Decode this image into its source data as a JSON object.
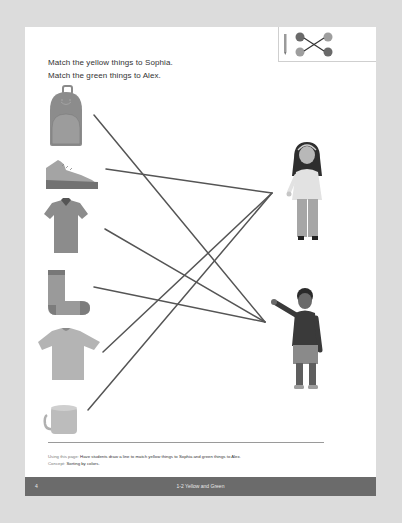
{
  "instructions": {
    "line1": "Match the yellow things to Sophia.",
    "line2": "Match the green things to Alex."
  },
  "icon_box": {
    "icon": "matching-lines-icon"
  },
  "items": [
    {
      "name": "backpack",
      "icon": "backpack-icon",
      "color": "yellow"
    },
    {
      "name": "sneaker",
      "icon": "sneaker-icon",
      "color": "green"
    },
    {
      "name": "polo-shirt",
      "icon": "polo-shirt-icon",
      "color": "green"
    },
    {
      "name": "sock",
      "icon": "sock-icon",
      "color": "green"
    },
    {
      "name": "t-shirt",
      "icon": "t-shirt-icon",
      "color": "yellow"
    },
    {
      "name": "mug",
      "icon": "mug-icon",
      "color": "yellow"
    }
  ],
  "people": [
    {
      "name": "Sophia",
      "icon": "girl-figure-icon"
    },
    {
      "name": "Alex",
      "icon": "boy-figure-icon"
    }
  ],
  "notes": {
    "using_label": "Using this page:",
    "using_text": "Have students draw a line to match yellow things to Sophia and green things to Alex.",
    "concept_label": "Concept:",
    "concept_text": "Sorting by colors."
  },
  "footer": {
    "page_number": "4",
    "title": "1-2  Yellow and Green"
  },
  "colors": {
    "background": "#dcdcdc",
    "page": "#ffffff",
    "line": "#555555",
    "footer": "#6b6b6b"
  }
}
